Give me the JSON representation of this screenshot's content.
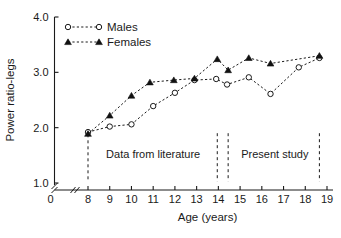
{
  "chart_data": {
    "type": "line",
    "title": "",
    "xlabel": "Age (years)",
    "ylabel": "Power ratio-legs",
    "xlim": [
      7.4,
      19.4
    ],
    "ylim": [
      1.0,
      4.0
    ],
    "xticks": [
      8,
      9,
      10,
      11,
      12,
      13,
      14,
      15,
      16,
      17,
      18,
      19
    ],
    "xtick_labels": [
      "8",
      "9",
      "10",
      "11",
      "12",
      "13",
      "14",
      "15",
      "16",
      "17",
      "18",
      "19"
    ],
    "yticks": [
      1.0,
      2.0,
      3.0,
      4.0
    ],
    "ytick_labels": [
      "1.0",
      "2.0",
      "3.0",
      "4.0"
    ],
    "origin_label": "0",
    "grid": false,
    "axis_break_x": true,
    "axis_break_y": true,
    "legend_position": "top-left",
    "series": [
      {
        "name": "Males",
        "marker": "open-circle",
        "x": [
          8.0,
          9.0,
          10.0,
          11.0,
          12.0,
          12.9,
          13.9,
          14.4,
          15.4,
          16.4,
          17.7,
          18.65
        ],
        "values": [
          1.92,
          2.02,
          2.06,
          2.39,
          2.63,
          2.86,
          2.88,
          2.78,
          2.91,
          2.61,
          3.09,
          3.26
        ]
      },
      {
        "name": "Females",
        "marker": "filled-triangle",
        "x": [
          8.0,
          9.0,
          10.0,
          10.85,
          11.95,
          12.9,
          13.95,
          14.45,
          15.4,
          16.4,
          18.65
        ],
        "values": [
          1.89,
          2.22,
          2.58,
          2.82,
          2.86,
          2.89,
          3.24,
          3.04,
          3.26,
          3.16,
          3.3
        ]
      }
    ],
    "annotations": [
      {
        "label": "Data from literature",
        "x_center": 11.0,
        "y": 1.52
      },
      {
        "label": "Present study",
        "x_center": 16.6,
        "y": 1.52
      }
    ],
    "divider_lines": [
      {
        "x": 8.0,
        "y_top": 1.88,
        "y_bottom": 1.03
      },
      {
        "x": 13.95,
        "y_top": 1.9,
        "y_bottom": 1.03
      },
      {
        "x": 14.45,
        "y_top": 1.9,
        "y_bottom": 1.03
      },
      {
        "x": 18.65,
        "y_top": 1.9,
        "y_bottom": 1.03
      }
    ],
    "colors": {
      "axis": "#1a1a1a",
      "males": "#1a1a1a",
      "females": "#111111",
      "background": "#ffffff"
    }
  }
}
